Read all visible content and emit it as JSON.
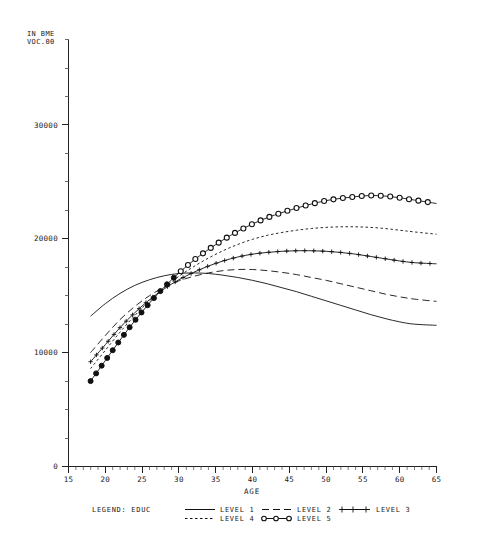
{
  "chart_data": {
    "type": "line",
    "title": "",
    "xlabel": "AGE",
    "ylabel_line1": "IN BME",
    "ylabel_line2": "VOC.00",
    "xlim": [
      15,
      65
    ],
    "ylim": [
      0,
      37500
    ],
    "xticks": [
      15,
      20,
      25,
      30,
      35,
      40,
      45,
      50,
      55,
      60,
      65
    ],
    "yticks": [
      0,
      10000,
      20000,
      30000
    ],
    "ytick_labels": [
      "0",
      "10000",
      "20000",
      "30000"
    ],
    "xtick_labels": [
      "15",
      "20",
      "25",
      "30",
      "35",
      "40",
      "45",
      "50",
      "55",
      "60",
      "65"
    ],
    "minor_y_step": 2500,
    "grid": false,
    "legend_position": "bottom",
    "legend_title": "LEGEND: EDUC",
    "x": [
      18,
      20,
      22,
      24,
      26,
      28,
      30,
      32,
      34,
      36,
      38,
      40,
      42,
      44,
      46,
      48,
      50,
      52,
      54,
      56,
      58,
      60,
      62,
      65
    ],
    "series": [
      {
        "name": "LEVEL 1",
        "style": "solid",
        "marker": "none",
        "values": [
          13200,
          14300,
          15200,
          15900,
          16400,
          16750,
          16950,
          17000,
          16950,
          16800,
          16600,
          16350,
          16050,
          15700,
          15350,
          14950,
          14550,
          14150,
          13750,
          13350,
          13000,
          12700,
          12500,
          12400
        ]
      },
      {
        "name": "LEVEL 2",
        "style": "dashed",
        "marker": "none",
        "values": [
          10000,
          11500,
          12900,
          14050,
          15000,
          15750,
          16300,
          16700,
          17000,
          17200,
          17300,
          17300,
          17200,
          17050,
          16850,
          16600,
          16350,
          16050,
          15750,
          15450,
          15150,
          14900,
          14700,
          14500
        ]
      },
      {
        "name": "LEVEL 3",
        "style": "solid",
        "marker": "plus",
        "values": [
          9200,
          10700,
          12200,
          13500,
          14650,
          15600,
          16400,
          17050,
          17600,
          18050,
          18400,
          18650,
          18800,
          18900,
          18950,
          18950,
          18900,
          18800,
          18650,
          18450,
          18250,
          18050,
          17900,
          17800
        ]
      },
      {
        "name": "LEVEL 4",
        "style": "dotted",
        "marker": "none",
        "values": [
          8600,
          10200,
          11800,
          13250,
          14550,
          15700,
          16700,
          17550,
          18300,
          18950,
          19500,
          19950,
          20300,
          20550,
          20750,
          20900,
          21000,
          21050,
          21050,
          21000,
          20900,
          20750,
          20600,
          20400
        ]
      },
      {
        "name": "LEVEL 5",
        "style": "solid",
        "marker": "circle",
        "values": [
          7500,
          9300,
          11100,
          12800,
          14350,
          15750,
          17000,
          18100,
          19050,
          19900,
          20650,
          21300,
          21850,
          22300,
          22700,
          23050,
          23350,
          23550,
          23700,
          23800,
          23750,
          23600,
          23400,
          23100
        ]
      }
    ],
    "legend_entries": [
      {
        "label": "LEVEL 1",
        "style": "solid",
        "marker": "none",
        "column": 1,
        "row": 1
      },
      {
        "label": "LEVEL 4",
        "style": "dotted",
        "marker": "none",
        "column": 1,
        "row": 2
      },
      {
        "label": "LEVEL 2",
        "style": "dashed",
        "marker": "none",
        "column": 2,
        "row": 1
      },
      {
        "label": "LEVEL 5",
        "style": "solid",
        "marker": "circle",
        "column": 2,
        "row": 2
      },
      {
        "label": "LEVEL 3",
        "style": "solid",
        "marker": "plus",
        "column": 3,
        "row": 1
      }
    ],
    "colors": {
      "ink": "#111111",
      "background": "#ffffff"
    }
  }
}
